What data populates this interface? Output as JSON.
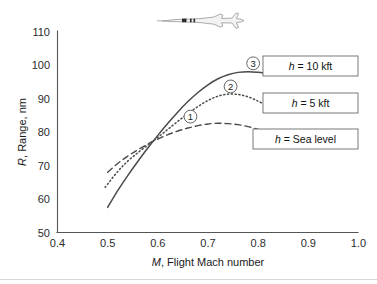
{
  "figure": {
    "background_color": "#ffffff",
    "aircraft_icon_name": "aircraft-top-view-icon"
  },
  "chart_data": {
    "type": "line",
    "title": "",
    "xlabel": "M, Flight Mach number",
    "xlabel_symbol": "M",
    "xlabel_rest": ", Flight Mach number",
    "ylabel": "R, Range, nm",
    "ylabel_symbol": "R",
    "ylabel_rest": ", Range, nm",
    "xlim": [
      0.4,
      1.0
    ],
    "ylim": [
      50,
      110
    ],
    "xticks": [
      "0.4",
      "0.5",
      "0.6",
      "0.7",
      "0.8",
      "0.9",
      "1.0"
    ],
    "xtick_values": [
      0.4,
      0.5,
      0.6,
      0.7,
      0.8,
      0.9,
      1.0
    ],
    "yticks": [
      "50",
      "60",
      "70",
      "80",
      "90",
      "100",
      "110"
    ],
    "ytick_values": [
      50,
      60,
      70,
      80,
      90,
      100,
      110
    ],
    "grid": false,
    "legend_position": "right-inside",
    "series": [
      {
        "name": "h = Sea level",
        "marker_label": "1",
        "style": "dashed",
        "x": [
          0.5,
          0.52,
          0.54,
          0.56,
          0.58,
          0.6,
          0.62,
          0.64,
          0.66,
          0.68,
          0.7,
          0.72,
          0.74,
          0.76,
          0.78,
          0.8,
          0.815
        ],
        "y": [
          68.0,
          70.6,
          72.8,
          74.7,
          76.4,
          77.9,
          79.2,
          80.3,
          81.2,
          81.9,
          82.4,
          82.6,
          82.5,
          82.2,
          81.6,
          80.8,
          80.2
        ]
      },
      {
        "name": "h = 5 kft",
        "marker_label": "2",
        "style": "dotted",
        "x": [
          0.495,
          0.52,
          0.54,
          0.56,
          0.58,
          0.6,
          0.62,
          0.64,
          0.66,
          0.68,
          0.7,
          0.72,
          0.74,
          0.76,
          0.78,
          0.8,
          0.815
        ],
        "y": [
          63.5,
          68.2,
          71.3,
          73.8,
          76.1,
          78.4,
          80.8,
          83.2,
          85.5,
          87.6,
          89.4,
          90.7,
          91.3,
          91.2,
          90.5,
          89.2,
          88.0
        ]
      },
      {
        "name": "h = 10 kft",
        "marker_label": "3",
        "style": "solid",
        "x": [
          0.5,
          0.52,
          0.54,
          0.56,
          0.58,
          0.6,
          0.62,
          0.64,
          0.66,
          0.68,
          0.7,
          0.72,
          0.74,
          0.76,
          0.78,
          0.8,
          0.815
        ],
        "y": [
          57.5,
          62.5,
          67.0,
          71.2,
          75.2,
          79.0,
          82.6,
          86.0,
          89.1,
          91.8,
          94.1,
          95.9,
          97.1,
          97.8,
          98.0,
          97.8,
          97.5
        ]
      }
    ],
    "annotations": [
      {
        "label": "1",
        "x": 0.665,
        "y": 84.6
      },
      {
        "label": "2",
        "x": 0.745,
        "y": 93.6
      },
      {
        "label": "3",
        "x": 0.79,
        "y": 100.5
      }
    ],
    "legend_entries": [
      {
        "text": "h = 10 kft",
        "symbol": "h",
        "rest": " = 10 kft"
      },
      {
        "text": "h = 5 kft",
        "symbol": "h",
        "rest": " = 5 kft"
      },
      {
        "text": "h = Sea level",
        "symbol": "h",
        "rest": " = Sea level"
      }
    ]
  }
}
